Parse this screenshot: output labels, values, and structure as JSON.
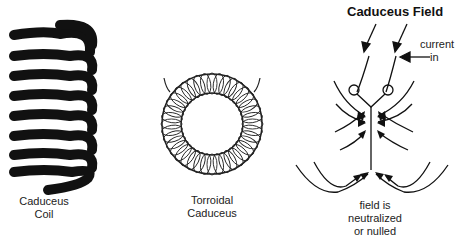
{
  "diagram": {
    "panels": [
      {
        "id": "coil",
        "label_line1": "Caduceus",
        "label_line2": "Coil"
      },
      {
        "id": "toroid",
        "label_line1": "Torroidal",
        "label_line2": "Caduceus"
      },
      {
        "id": "field",
        "title": "Caduceus Field",
        "annotation_line1": "current",
        "annotation_line2": "in",
        "label_line1": "field is",
        "label_line2": "neutralized",
        "label_line3": "or nulled"
      }
    ],
    "colors": {
      "ink": "#111111",
      "background": "#ffffff"
    }
  }
}
